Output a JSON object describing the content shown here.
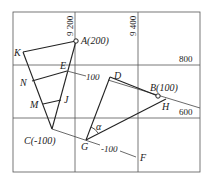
{
  "grid": {
    "vertical_labels": [
      {
        "id": "x9200",
        "text": "9 200"
      },
      {
        "id": "x9400",
        "text": "9 400"
      }
    ],
    "horizontal_labels": [
      {
        "id": "y800",
        "text": "800"
      },
      {
        "id": "y600",
        "text": "600"
      }
    ]
  },
  "points": {
    "A": "A(200)",
    "B": "B(100)",
    "C": "C(-100)",
    "D": "D",
    "E": "E",
    "F": "F",
    "G": "G",
    "H": "H",
    "J": "J",
    "K": "K",
    "M": "M",
    "N": "N"
  },
  "contour_labels": {
    "upper": "100",
    "lower": "-100"
  },
  "angle_label": "α",
  "colors": {
    "line": "#222222",
    "grid": "#555555"
  }
}
